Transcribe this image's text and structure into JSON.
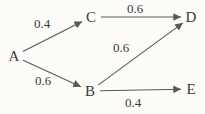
{
  "diagram": {
    "type": "weighted-directed-graph",
    "background_color": "#fdfcf9",
    "line_color": "#585858",
    "text_color": "#3a3a3a",
    "nodes": [
      {
        "id": "A",
        "label": "A",
        "x": 14,
        "y": 56
      },
      {
        "id": "C",
        "label": "C",
        "x": 91,
        "y": 17
      },
      {
        "id": "D",
        "label": "D",
        "x": 191,
        "y": 17
      },
      {
        "id": "B",
        "label": "B",
        "x": 90,
        "y": 91
      },
      {
        "id": "E",
        "label": "E",
        "x": 191,
        "y": 89
      }
    ],
    "edges": [
      {
        "from": "A",
        "to": "C",
        "weight": "0.4",
        "label_x": 42,
        "label_y": 28
      },
      {
        "from": "C",
        "to": "D",
        "weight": "0.6",
        "label_x": 135,
        "label_y": 13
      },
      {
        "from": "A",
        "to": "B",
        "weight": "0.6",
        "label_x": 43,
        "label_y": 85
      },
      {
        "from": "B",
        "to": "D",
        "weight": "0.6",
        "label_x": 121,
        "label_y": 52
      },
      {
        "from": "B",
        "to": "E",
        "weight": "0.4",
        "label_x": 133,
        "label_y": 107
      }
    ]
  }
}
